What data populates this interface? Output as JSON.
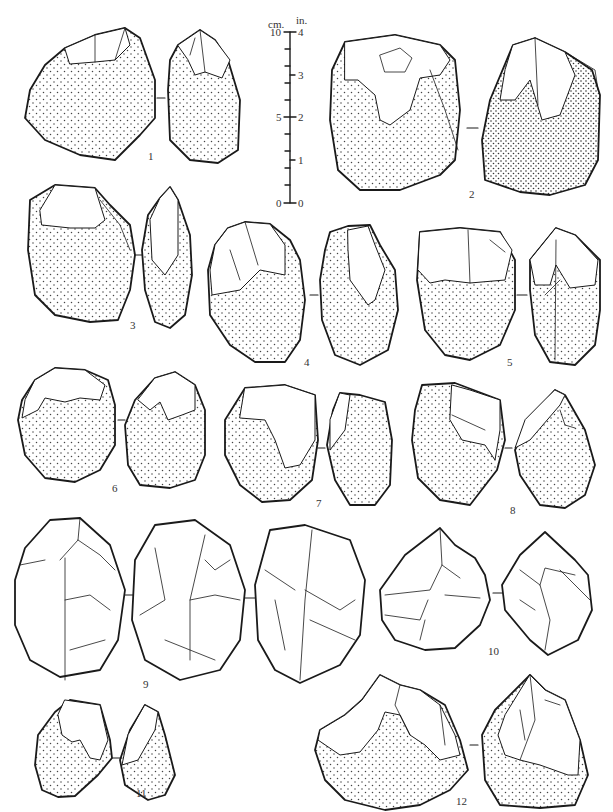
{
  "scale_bar": {
    "unit_left": "cm.",
    "unit_right": "in.",
    "cm_labels": [
      "10",
      "5",
      "0"
    ],
    "in_labels": [
      "4",
      "3",
      "2",
      "1",
      "0"
    ]
  },
  "figures": [
    {
      "number": "1",
      "views": 2,
      "cortex": "stippled"
    },
    {
      "number": "2",
      "views": 2,
      "cortex": "stippled"
    },
    {
      "number": "3",
      "views": 2,
      "cortex": "stippled"
    },
    {
      "number": "4",
      "views": 2,
      "cortex": "stippled"
    },
    {
      "number": "5",
      "views": 2,
      "cortex": "stippled"
    },
    {
      "number": "6",
      "views": 2,
      "cortex": "stippled"
    },
    {
      "number": "7",
      "views": 2,
      "cortex": "stippled"
    },
    {
      "number": "8",
      "views": 2,
      "cortex": "stippled"
    },
    {
      "number": "9",
      "views": 3,
      "cortex": "none"
    },
    {
      "number": "10",
      "views": 2,
      "cortex": "none"
    },
    {
      "number": "11",
      "views": 2,
      "cortex": "stippled"
    },
    {
      "number": "12",
      "views": 2,
      "cortex": "stippled"
    }
  ],
  "colors": {
    "ink": "#1a1a1a",
    "paper": "#ffffff",
    "stipple": "#444444"
  }
}
